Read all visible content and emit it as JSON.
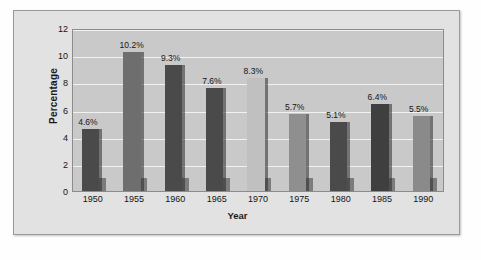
{
  "chart_data": {
    "type": "bar",
    "title": "",
    "xlabel": "Year",
    "ylabel": "Percentage",
    "categories": [
      "1950",
      "1955",
      "1960",
      "1965",
      "1970",
      "1975",
      "1980",
      "1985",
      "1990"
    ],
    "values": [
      4.6,
      10.2,
      9.3,
      7.6,
      8.3,
      5.7,
      5.1,
      6.4,
      5.5
    ],
    "data_labels": [
      "4.6%",
      "10.2%",
      "9.3%",
      "7.6%",
      "8.3%",
      "5.7%",
      "5.1%",
      "6.4%",
      "5.5%"
    ],
    "bar_colors": [
      "#4a4a4a",
      "#6e6e6e",
      "#4a4a4a",
      "#4a4a4a",
      "#c0c0c0",
      "#8f8f8f",
      "#4a4a4a",
      "#3f3f3f",
      "#8a8a8a"
    ],
    "ylim": [
      0,
      12
    ],
    "yticks": [
      "0",
      "2",
      "4",
      "6",
      "8",
      "10",
      "12"
    ],
    "ytick_values": [
      0,
      2,
      4,
      6,
      8,
      10,
      12
    ],
    "grid": true,
    "legend": "none",
    "plot_background": "#c9c9c9",
    "gridline_color": "#f2f2f2",
    "frame_background": "#e2e2e2"
  }
}
